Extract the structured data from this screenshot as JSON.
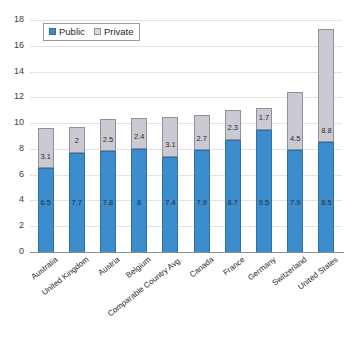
{
  "chart_data": {
    "type": "bar",
    "stacked": true,
    "title": "",
    "xlabel": "",
    "ylabel": "",
    "ylim": [
      0,
      18
    ],
    "ytick_step": 2,
    "yticks": [
      0,
      2,
      4,
      6,
      8,
      10,
      12,
      14,
      16,
      18
    ],
    "grid": true,
    "legend_position": "top-left",
    "categories": [
      "Australia",
      "United Kingdom",
      "Austria",
      "Belgium",
      "Comparable Country Avg.",
      "Canada",
      "France",
      "Germany",
      "Switzerland",
      "United States"
    ],
    "series": [
      {
        "name": "Public",
        "color": "#3c8dcd",
        "values": [
          6.5,
          7.7,
          7.8,
          8,
          7.4,
          7.9,
          8.7,
          9.5,
          7.9,
          8.5
        ],
        "labels": [
          "6.5",
          "7.7",
          "7.8",
          "8",
          "7.4",
          "7.9",
          "8.7",
          "9.5",
          "7.9",
          "8.5"
        ]
      },
      {
        "name": "Private",
        "color": "#c9cad2",
        "values": [
          3.1,
          2,
          2.5,
          2.4,
          3.1,
          2.7,
          2.3,
          1.7,
          4.5,
          8.8
        ],
        "labels": [
          "3.1",
          "2",
          "2.5",
          "2.4",
          "3.1",
          "2.7",
          "2.3",
          "1.7",
          "4.5",
          "8.8"
        ]
      }
    ],
    "totals": [
      9.6,
      9.7,
      10.3,
      10.4,
      10.5,
      10.6,
      11.0,
      11.2,
      12.4,
      17.3
    ]
  },
  "legend": {
    "items": [
      {
        "label": "Public"
      },
      {
        "label": "Private"
      }
    ]
  }
}
